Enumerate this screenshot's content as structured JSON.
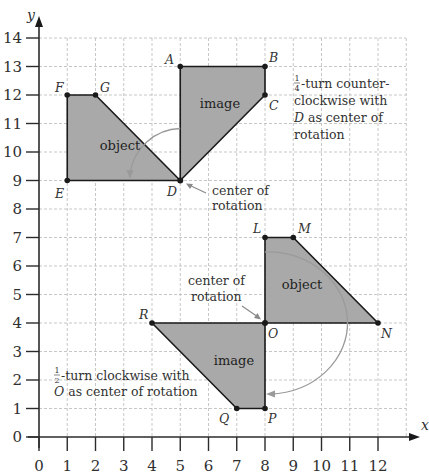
{
  "figure": {
    "axes": {
      "x_label": "x",
      "y_label": "y",
      "x_ticks": [
        "0",
        "1",
        "2",
        "3",
        "4",
        "5",
        "6",
        "7",
        "8",
        "9",
        "10",
        "11",
        "12"
      ],
      "y_ticks": [
        "0",
        "1",
        "2",
        "3",
        "4",
        "5",
        "6",
        "7",
        "8",
        "9",
        "10",
        "11",
        "12",
        "13",
        "14"
      ],
      "x_range": [
        0,
        12
      ],
      "y_range": [
        0,
        14
      ]
    },
    "rotation_1": {
      "object": {
        "label": "object",
        "vertices": [
          {
            "name": "E",
            "x": 1,
            "y": 9
          },
          {
            "name": "F",
            "x": 1,
            "y": 12
          },
          {
            "name": "G",
            "x": 2,
            "y": 12
          },
          {
            "name": "D",
            "x": 5,
            "y": 9
          }
        ]
      },
      "image": {
        "label": "image",
        "vertices": [
          {
            "name": "A",
            "x": 5,
            "y": 13
          },
          {
            "name": "B",
            "x": 8,
            "y": 13
          },
          {
            "name": "C",
            "x": 8,
            "y": 12
          },
          {
            "name": "D",
            "x": 5,
            "y": 9
          }
        ]
      },
      "center": {
        "name": "D",
        "x": 5,
        "y": 9
      },
      "center_label_line1": "center of",
      "center_label_line2": "rotation",
      "note_fraction_num": "1",
      "note_fraction_den": "4",
      "note_line1": "-turn counter-",
      "note_line2": "clockwise with",
      "note_line3_var": "D",
      "note_line3": " as center of",
      "note_line4": "rotation"
    },
    "rotation_2": {
      "object": {
        "label": "object",
        "vertices": [
          {
            "name": "L",
            "x": 8,
            "y": 7
          },
          {
            "name": "M",
            "x": 9,
            "y": 7
          },
          {
            "name": "N",
            "x": 12,
            "y": 4
          },
          {
            "name": "O",
            "x": 8,
            "y": 4
          }
        ]
      },
      "image": {
        "label": "image",
        "vertices": [
          {
            "name": "R",
            "x": 4,
            "y": 4
          },
          {
            "name": "O",
            "x": 8,
            "y": 4
          },
          {
            "name": "P",
            "x": 8,
            "y": 1
          },
          {
            "name": "Q",
            "x": 7,
            "y": 1
          }
        ]
      },
      "center": {
        "name": "O",
        "x": 8,
        "y": 4
      },
      "center_label_line1": "center of",
      "center_label_line2": "rotation",
      "note_fraction_num": "1",
      "note_fraction_den": "2",
      "note_line1": "-turn clockwise with",
      "note_line2_var": "O",
      "note_line2": " as center of rotation"
    },
    "colors": {
      "shape_fill": "#a9a9a9",
      "shape_stroke": "#1a1a1a",
      "grid": "#b9b9b9",
      "arc": "#9a9a9a"
    }
  }
}
